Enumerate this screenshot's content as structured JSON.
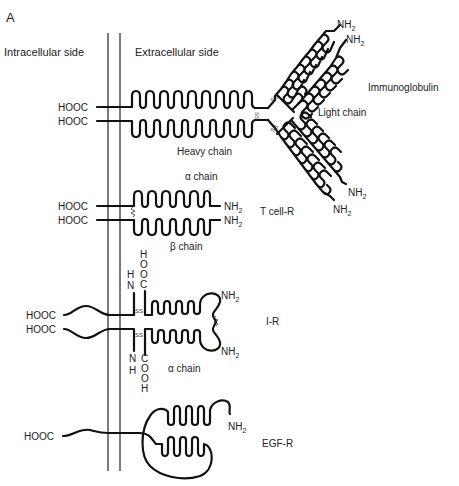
{
  "panel_label": "A",
  "sides": {
    "intracellular": "Intracellular side",
    "extracellular": "Extracellular side"
  },
  "immunoglobulin": {
    "name": "Immunoglobulin",
    "heavy_chain": "Heavy chain",
    "light_chain": "Light chain",
    "c_terminus": "HOOC",
    "n_terminus": "NH",
    "n_sub": "2",
    "disulfide": "SS"
  },
  "tcell_receptor": {
    "name": "T cell-R",
    "alpha_chain": "α chain",
    "beta_chain": "β chain",
    "c_terminus": "HOOC",
    "n_terminus": "NH",
    "n_sub": "2"
  },
  "insulin_receptor": {
    "name": "I-R",
    "alpha_chain": "α chain",
    "c_terminus": "HOOC",
    "n_terminus": "NH",
    "n_sub": "2",
    "vertical_top_nh2": [
      "H",
      "N"
    ],
    "vertical_top_cooh": [
      "H",
      "O",
      "O",
      "C"
    ],
    "vertical_bottom_nh2": [
      "N",
      "H"
    ],
    "vertical_bottom_cooh": [
      "C",
      "O",
      "O",
      "H"
    ],
    "disulfide": "SS"
  },
  "egf_receptor": {
    "name": "EGF-R",
    "c_terminus": "HOOC",
    "n_terminus": "NH",
    "n_sub": "2"
  }
}
